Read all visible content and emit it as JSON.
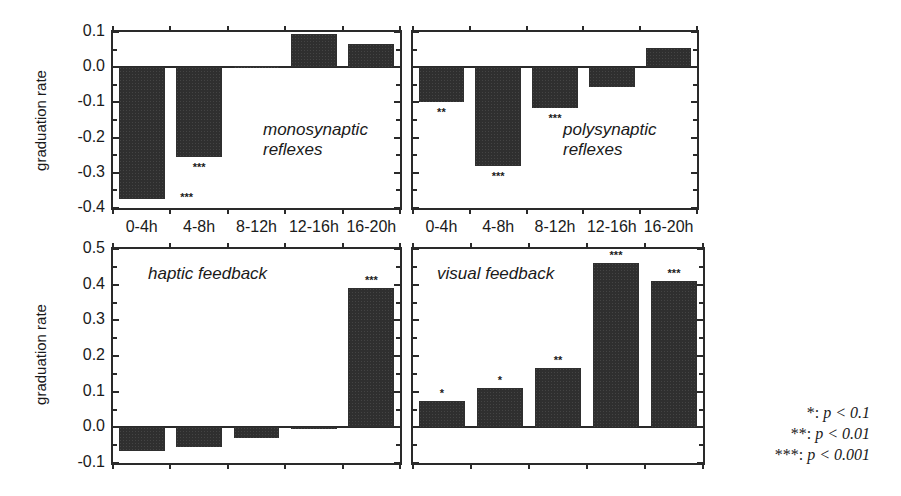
{
  "chart_data": [
    {
      "type": "bar",
      "panel": "top-left",
      "title": "monosynaptic reflexes",
      "title_lines": [
        "monosynaptic",
        "reflexes"
      ],
      "categories": [
        "0-4h",
        "4-8h",
        "8-12h",
        "12-16h",
        "16-20h"
      ],
      "values": [
        -0.375,
        -0.255,
        0.002,
        0.095,
        0.065
      ],
      "significance": [
        "***",
        "***",
        "",
        "",
        ""
      ],
      "ylabel": "graduation rate",
      "ylim": [
        -0.4,
        0.1
      ],
      "yticks": [
        "0.1",
        "0.0",
        "-0.1",
        "-0.2",
        "-0.3",
        "-0.4"
      ]
    },
    {
      "type": "bar",
      "panel": "top-right",
      "title": "polysynaptic reflexes",
      "title_lines": [
        "polysynaptic",
        "reflexes"
      ],
      "categories": [
        "0-4h",
        "4-8h",
        "8-12h",
        "12-16h",
        "16-20h"
      ],
      "values": [
        -0.1,
        -0.28,
        -0.115,
        -0.055,
        0.055
      ],
      "significance": [
        "**",
        "***",
        "***",
        "",
        ""
      ],
      "ylim": [
        -0.4,
        0.1
      ]
    },
    {
      "type": "bar",
      "panel": "bottom-left",
      "title": "haptic feedback",
      "categories": [
        "0-4h",
        "4-8h",
        "8-12h",
        "12-16h",
        "16-20h"
      ],
      "values": [
        -0.065,
        -0.055,
        -0.03,
        0.002,
        0.39
      ],
      "significance": [
        "",
        "",
        "",
        "",
        "***"
      ],
      "ylabel": "graduation rate",
      "ylim": [
        -0.1,
        0.5
      ],
      "yticks": [
        "0.5",
        "0.4",
        "0.3",
        "0.2",
        "0.1",
        "0.0",
        "-0.1"
      ]
    },
    {
      "type": "bar",
      "panel": "bottom-right",
      "title": "visual feedback",
      "categories": [
        "0-4h",
        "4-8h",
        "8-12h",
        "12-16h",
        "16-20h"
      ],
      "values": [
        0.075,
        0.11,
        0.165,
        0.46,
        0.41
      ],
      "significance": [
        "*",
        "*",
        "**",
        "***",
        "***"
      ],
      "ylim": [
        -0.1,
        0.5
      ]
    }
  ],
  "legend": [
    {
      "stars": "*",
      "text": "p < 0.1"
    },
    {
      "stars": "**",
      "text": "p < 0.01"
    },
    {
      "stars": "***",
      "text": "p < 0.001"
    }
  ],
  "axis": {
    "ylabel": "graduation rate",
    "xcategories": [
      "0-4h",
      "4-8h",
      "8-12h",
      "12-16h",
      "16-20h"
    ]
  }
}
